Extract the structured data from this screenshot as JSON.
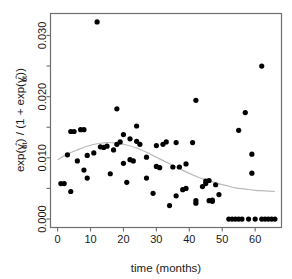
{
  "chart_data": {
    "type": "scatter",
    "title": "",
    "xlabel": "time (months)",
    "ylabel": "exp(γ̂₀ₜ) / (1 + exp(γ̂₀ₜ))",
    "ylabel_parts": {
      "prefix": "exp(",
      "gamma": "γ",
      "hat": "̂",
      "sub1": "0t",
      "mid": ") / (1 + exp(",
      "sub2": "0t",
      "suffix": "))"
    },
    "xlim": [
      -2,
      68
    ],
    "ylim": [
      -0.0013,
      0.0335
    ],
    "xticks": [
      0,
      10,
      20,
      30,
      40,
      50,
      60
    ],
    "xtick_labels": [
      "0",
      "10",
      "20",
      "30",
      "40",
      "50",
      "60"
    ],
    "yticks": [
      0.0,
      0.005,
      0.01,
      0.015,
      0.02,
      0.025,
      0.03
    ],
    "ytick_labels": [
      "0.000",
      "",
      "0.010",
      "",
      "0.020",
      "",
      "0.030"
    ],
    "grid": false,
    "legend": null,
    "point_color": "#000000",
    "curve_color": "#b9b9b9",
    "frame_color": "#6e6e6e",
    "point_radius_px": 2.6,
    "series": [
      {
        "name": "observed proportions",
        "marker": "filled-circle",
        "points": [
          [
            1,
            0.0058
          ],
          [
            2,
            0.0058
          ],
          [
            3,
            0.0105
          ],
          [
            4,
            0.0143
          ],
          [
            4,
            0.0045
          ],
          [
            5,
            0.0143
          ],
          [
            6,
            0.0095
          ],
          [
            7,
            0.0146
          ],
          [
            8,
            0.0146
          ],
          [
            8,
            0.008
          ],
          [
            9,
            0.0104
          ],
          [
            9,
            0.0067
          ],
          [
            11,
            0.0108
          ],
          [
            12,
            0.0322
          ],
          [
            13,
            0.0118
          ],
          [
            14,
            0.0117
          ],
          [
            15,
            0.0119
          ],
          [
            16,
            0.0074
          ],
          [
            17,
            0.0113
          ],
          [
            18,
            0.018
          ],
          [
            18,
            0.0122
          ],
          [
            19,
            0.0126
          ],
          [
            20,
            0.0138
          ],
          [
            20,
            0.0091
          ],
          [
            21,
            0.006
          ],
          [
            22,
            0.0131
          ],
          [
            22,
            0.0097
          ],
          [
            23,
            0.0095
          ],
          [
            24,
            0.0152
          ],
          [
            24,
            0.0127
          ],
          [
            25,
            0.0122
          ],
          [
            27,
            0.0101
          ],
          [
            27,
            0.0067
          ],
          [
            29,
            0.0042
          ],
          [
            30,
            0.012
          ],
          [
            30,
            0.0086
          ],
          [
            31,
            0.0084
          ],
          [
            32,
            0.0122
          ],
          [
            33,
            0.0126
          ],
          [
            34,
            0.0022
          ],
          [
            35,
            0.0085
          ],
          [
            36,
            0.0125
          ],
          [
            36,
            0.0038
          ],
          [
            37,
            0.0085
          ],
          [
            38,
            0.0048
          ],
          [
            39,
            0.005
          ],
          [
            39,
            0.009
          ],
          [
            41,
            0.0125
          ],
          [
            42,
            0.0194
          ],
          [
            42,
            0.003
          ],
          [
            42,
            0.0026
          ],
          [
            44,
            0.0053
          ],
          [
            45,
            0.0058
          ],
          [
            45,
            0.0062
          ],
          [
            46,
            0.0063
          ],
          [
            46,
            0.003
          ],
          [
            47,
            0.0031
          ],
          [
            47,
            0.0029
          ],
          [
            48,
            0.0056
          ],
          [
            49,
            0.004
          ],
          [
            52,
            0.0
          ],
          [
            53,
            0.0
          ],
          [
            54,
            0.0
          ],
          [
            55,
            0.0145
          ],
          [
            55,
            0.0
          ],
          [
            56,
            0.0
          ],
          [
            57,
            0.0174
          ],
          [
            58,
            0.0
          ],
          [
            59,
            0.0106
          ],
          [
            59,
            0.0075
          ],
          [
            60,
            0.0
          ],
          [
            62,
            0.025
          ],
          [
            62,
            0.0
          ],
          [
            63,
            0.0
          ],
          [
            64,
            0.0
          ],
          [
            65,
            0.0
          ],
          [
            66,
            0.0
          ]
        ]
      }
    ],
    "smoother": {
      "name": "loess smooth",
      "points": [
        [
          0,
          0.0097
        ],
        [
          3,
          0.0106
        ],
        [
          6,
          0.0113
        ],
        [
          9,
          0.0119
        ],
        [
          12,
          0.0123
        ],
        [
          15,
          0.0125
        ],
        [
          18,
          0.0124
        ],
        [
          21,
          0.0121
        ],
        [
          24,
          0.0116
        ],
        [
          27,
          0.0109
        ],
        [
          30,
          0.0101
        ],
        [
          33,
          0.0093
        ],
        [
          36,
          0.0085
        ],
        [
          39,
          0.0077
        ],
        [
          42,
          0.007
        ],
        [
          45,
          0.0064
        ],
        [
          48,
          0.0059
        ],
        [
          51,
          0.0055
        ],
        [
          54,
          0.0051
        ],
        [
          57,
          0.0049
        ],
        [
          60,
          0.0047
        ],
        [
          63,
          0.0046
        ],
        [
          66,
          0.0045
        ]
      ]
    }
  }
}
